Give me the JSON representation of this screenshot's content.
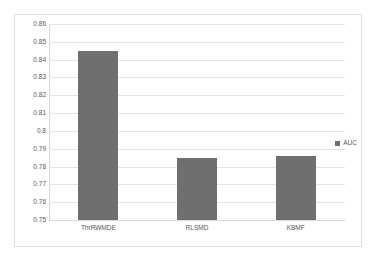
{
  "chart_data": {
    "type": "bar",
    "title": "",
    "xlabel": "",
    "ylabel": "",
    "categories": [
      "ThrRWMDE",
      "RLSMD",
      "KBMF"
    ],
    "values": [
      0.845,
      0.785,
      0.786
    ],
    "series": [
      {
        "name": "AUC",
        "values": [
          0.845,
          0.785,
          0.786
        ]
      }
    ],
    "ylim": [
      0.75,
      0.86
    ],
    "ytick_step": 0.01,
    "ytick_labels": [
      "0.86",
      "0.85",
      "0.84",
      "0.83",
      "0.82",
      "0.81",
      "0.8",
      "0.79",
      "0.78",
      "0.77",
      "0.76",
      "0.75"
    ],
    "ytick_values": [
      0.86,
      0.85,
      0.84,
      0.83,
      0.82,
      0.81,
      0.8,
      0.79,
      0.78,
      0.77,
      0.76,
      0.75
    ],
    "grid": true,
    "legend": {
      "entries": [
        "AUC"
      ],
      "position": "right"
    },
    "colors": {
      "bar": "#6f6f6f",
      "gridline": "#e4e4e4",
      "axis": "#d4d4d4",
      "text": "#58595b",
      "border": "#dcdcdc",
      "background": "#ffffff"
    }
  },
  "legend": {
    "auc_label": "AUC"
  }
}
